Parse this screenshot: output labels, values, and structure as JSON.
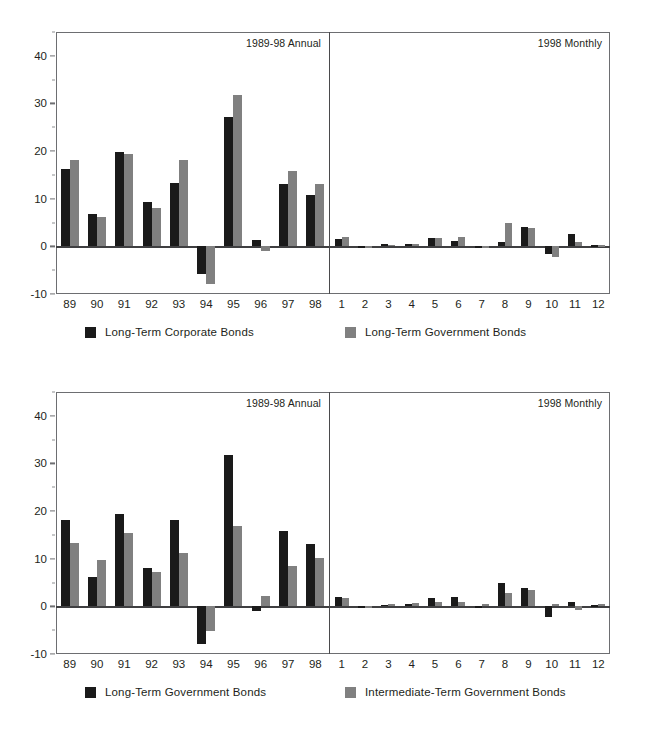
{
  "page": {
    "background": "#ffffff",
    "series_a_color": "#1a1a1a",
    "series_b_color": "#808080"
  },
  "axis": {
    "y_ticks": [
      "40",
      "30",
      "20",
      "10",
      "0",
      "-10"
    ],
    "annual_ticks": [
      "89",
      "90",
      "91",
      "92",
      "93",
      "94",
      "95",
      "96",
      "97",
      "98"
    ],
    "monthly_ticks": [
      "1",
      "2",
      "3",
      "4",
      "5",
      "6",
      "7",
      "8",
      "9",
      "10",
      "11",
      "12"
    ]
  },
  "panels": {
    "annual_label": "1989-98 Annual",
    "monthly_label": "1998 Monthly"
  },
  "charts": [
    {
      "id": "chart-top",
      "legend": [
        {
          "label": "Long-Term Corporate Bonds",
          "color": "#1a1a1a"
        },
        {
          "label": "Long-Term Government Bonds",
          "color": "#808080"
        }
      ]
    },
    {
      "id": "chart-bottom",
      "legend": [
        {
          "label": "Long-Term Government Bonds",
          "color": "#1a1a1a"
        },
        {
          "label": "Intermediate-Term Government Bonds",
          "color": "#808080"
        }
      ]
    }
  ],
  "chart_data": [
    {
      "type": "bar",
      "title": "Long-Term Corporate Bonds vs Long-Term Government Bonds",
      "xlabel": "",
      "ylabel": "",
      "ylim": [
        -10,
        45
      ],
      "grid": false,
      "legend_position": "bottom",
      "panels": [
        {
          "name": "1989-98 Annual",
          "categories": [
            "89",
            "90",
            "91",
            "92",
            "93",
            "94",
            "95",
            "96",
            "97",
            "98"
          ],
          "series": [
            {
              "name": "Long-Term Corporate Bonds",
              "color": "#1a1a1a",
              "values": [
                16.2,
                6.8,
                19.9,
                9.4,
                13.2,
                -5.8,
                27.2,
                1.4,
                13.0,
                10.8
              ]
            },
            {
              "name": "Long-Term Government Bonds",
              "color": "#808080",
              "values": [
                18.1,
                6.2,
                19.3,
                8.1,
                18.2,
                -7.8,
                31.7,
                -0.9,
                15.9,
                13.1
              ]
            }
          ]
        },
        {
          "name": "1998 Monthly",
          "categories": [
            "1",
            "2",
            "3",
            "4",
            "5",
            "6",
            "7",
            "8",
            "9",
            "10",
            "11",
            "12"
          ],
          "series": [
            {
              "name": "Long-Term Corporate Bonds",
              "color": "#1a1a1a",
              "values": [
                1.5,
                -0.4,
                0.4,
                0.6,
                1.7,
                1.2,
                -0.2,
                0.9,
                4.0,
                -1.5,
                2.7,
                0.2
              ]
            },
            {
              "name": "Long-Term Government Bonds",
              "color": "#808080",
              "values": [
                2.0,
                -0.4,
                0.3,
                0.5,
                1.8,
                2.0,
                -0.1,
                4.9,
                3.9,
                -2.2,
                1.0,
                0.2
              ]
            }
          ]
        }
      ]
    },
    {
      "type": "bar",
      "title": "Long-Term Government Bonds vs Intermediate-Term Government Bonds",
      "xlabel": "",
      "ylabel": "",
      "ylim": [
        -10,
        45
      ],
      "grid": false,
      "legend_position": "bottom",
      "panels": [
        {
          "name": "1989-98 Annual",
          "categories": [
            "89",
            "90",
            "91",
            "92",
            "93",
            "94",
            "95",
            "96",
            "97",
            "98"
          ],
          "series": [
            {
              "name": "Long-Term Government Bonds",
              "color": "#1a1a1a",
              "values": [
                18.1,
                6.2,
                19.3,
                8.1,
                18.2,
                -7.8,
                31.7,
                -0.9,
                15.9,
                13.1
              ]
            },
            {
              "name": "Intermediate-Term Government Bonds",
              "color": "#808080",
              "values": [
                13.3,
                9.7,
                15.5,
                7.2,
                11.2,
                -5.1,
                16.8,
                2.1,
                8.4,
                10.2
              ]
            }
          ]
        },
        {
          "name": "1998 Monthly",
          "categories": [
            "1",
            "2",
            "3",
            "4",
            "5",
            "6",
            "7",
            "8",
            "9",
            "10",
            "11",
            "12"
          ],
          "series": [
            {
              "name": "Long-Term Government Bonds",
              "color": "#1a1a1a",
              "values": [
                2.0,
                -0.4,
                0.3,
                0.5,
                1.8,
                2.0,
                -0.1,
                4.9,
                3.9,
                -2.2,
                1.0,
                0.2
              ]
            },
            {
              "name": "Intermediate-Term Government Bonds",
              "color": "#808080",
              "values": [
                1.7,
                -0.2,
                0.4,
                0.7,
                1.0,
                1.0,
                0.4,
                2.8,
                3.5,
                0.6,
                -0.7,
                0.4
              ]
            }
          ]
        }
      ]
    }
  ]
}
